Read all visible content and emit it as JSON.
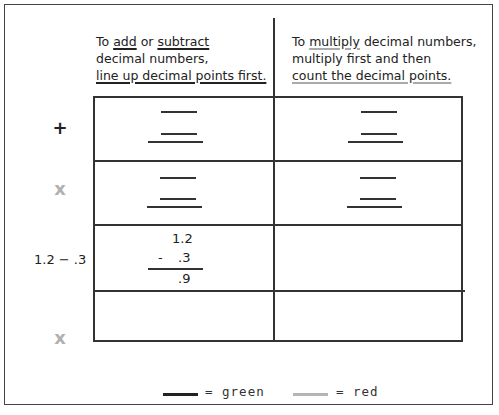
{
  "headers": {
    "left": {
      "line1_pre": "To ",
      "line1_word1": "add",
      "line1_mid": " or ",
      "line1_word2": "subtract",
      "line2": "decimal numbers,",
      "line3": "line up decimal points first."
    },
    "right": {
      "line1_pre": "To ",
      "line1_word": "multiply",
      "line1_post": " decimal numbers,",
      "line2": "multiply first and then",
      "line3": "count the decimal points."
    }
  },
  "rows": [
    {
      "label": "+",
      "label_color": "#222222"
    },
    {
      "label": "x",
      "label_color": "#b0b0b0"
    },
    {
      "label": "1.2 − .3",
      "label_color": "#222222"
    },
    {
      "label": "x",
      "label_color": "#b0b0b0"
    }
  ],
  "example": {
    "top": "1.2",
    "operator": "-",
    "bottom": ".3",
    "result": ".9"
  },
  "legend": {
    "green_label": "= green",
    "red_label": "= red",
    "green_color": "#222222",
    "red_color": "#b5b5b5"
  }
}
